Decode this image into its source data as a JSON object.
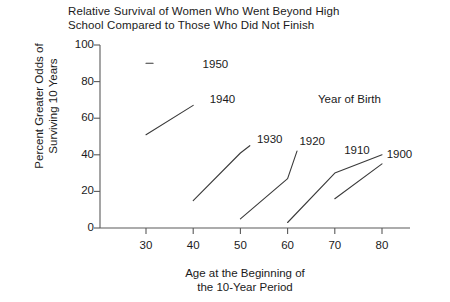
{
  "chart_data": {
    "type": "line",
    "title": "Relative Survival of Women Who Went Beyond High School Compared to Those Who Did Not Finish",
    "title_line1": "Relative Survival of Women Who Went Beyond High",
    "title_line2": "School Compared to Those Who Did Not Finish",
    "xlabel": "Age at the Beginning of the 10-Year Period",
    "xlabel_line1": "Age at the Beginning of",
    "xlabel_line2": "the 10-Year Period",
    "ylabel": "Percent Greater Odds of Surviving 10 Years",
    "ylabel_line1": "Percent Greater Odds of",
    "ylabel_line2": "Surviving 10 Years",
    "legend_title": "Year of Birth",
    "legend_position": "inline-series-labels",
    "grid": false,
    "xlim": [
      25,
      85
    ],
    "ylim": [
      0,
      100
    ],
    "xticks": [
      30,
      40,
      50,
      60,
      70,
      80
    ],
    "yticks": [
      0,
      20,
      40,
      60,
      80,
      100
    ],
    "xtick_labels": [
      "30",
      "40",
      "50",
      "60",
      "70",
      "80"
    ],
    "ytick_labels": [
      "0",
      "20",
      "40",
      "60",
      "80",
      "100"
    ],
    "line_color": "#3a3a3a",
    "axis_color": "#5a5a5a",
    "series": [
      {
        "name": "1950",
        "label": "1950",
        "label_x": 42,
        "label_y": 89,
        "x": [
          30,
          31.5
        ],
        "values": [
          90,
          90
        ]
      },
      {
        "name": "1940",
        "label": "1940",
        "label_x": 43.5,
        "label_y": 70,
        "x": [
          30,
          40
        ],
        "values": [
          51,
          67
        ]
      },
      {
        "name": "1930",
        "label": "1930",
        "label_x": 53.5,
        "label_y": 48,
        "x": [
          40,
          50,
          52
        ],
        "values": [
          15,
          41,
          45
        ]
      },
      {
        "name": "1920",
        "label": "1920",
        "label_x": 62.5,
        "label_y": 47,
        "x": [
          50,
          60,
          62
        ],
        "values": [
          5,
          27,
          42
        ]
      },
      {
        "name": "1910",
        "label": "1910",
        "label_x": 72,
        "label_y": 42,
        "x": [
          60,
          70,
          80
        ],
        "values": [
          3,
          30,
          40
        ]
      },
      {
        "name": "1900",
        "label": "1900",
        "label_x": 81,
        "label_y": 40,
        "x": [
          70,
          80
        ],
        "values": [
          16,
          35
        ]
      }
    ]
  }
}
